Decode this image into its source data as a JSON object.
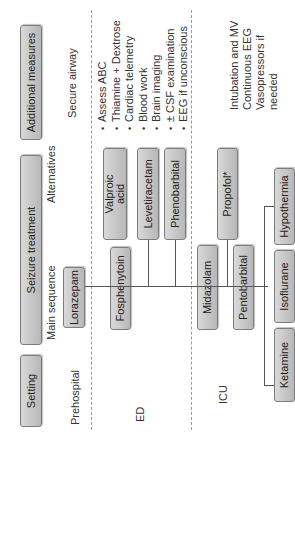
{
  "headers": {
    "setting": "Setting",
    "seizure_treatment": "Seizure treatment",
    "additional_measures": "Additional measures"
  },
  "subheaders": {
    "main_sequence": "Main sequence",
    "alternatives": "Alternatives"
  },
  "rows": {
    "prehospital": {
      "setting": "Prehospital",
      "main": "Lorazepam",
      "additional": "Secure airway"
    },
    "ed": {
      "setting": "ED",
      "main": "Fosphenytoin",
      "alternatives": [
        "Valproic acid",
        "Levetiracetam",
        "Phenobarbital"
      ],
      "additional": [
        "Assess ABC",
        "Thiamine + Dextrose",
        "Cardiac telemetry",
        "Blood work",
        "Brain imaging",
        "± CSF examination",
        "EEG if unconscious"
      ]
    },
    "icu": {
      "setting": "ICU",
      "main": [
        "Midazolam",
        "Pentobarbital"
      ],
      "alternatives": [
        "Propofol*"
      ],
      "refractory": [
        "Hypothermia",
        "Isoflurane",
        "Ketamine"
      ],
      "additional": [
        "Intubation and MV",
        "Continuous EEG",
        "Vasopressors if",
        "needed"
      ]
    }
  },
  "valproic_lines": [
    "Valproic",
    "acid"
  ]
}
